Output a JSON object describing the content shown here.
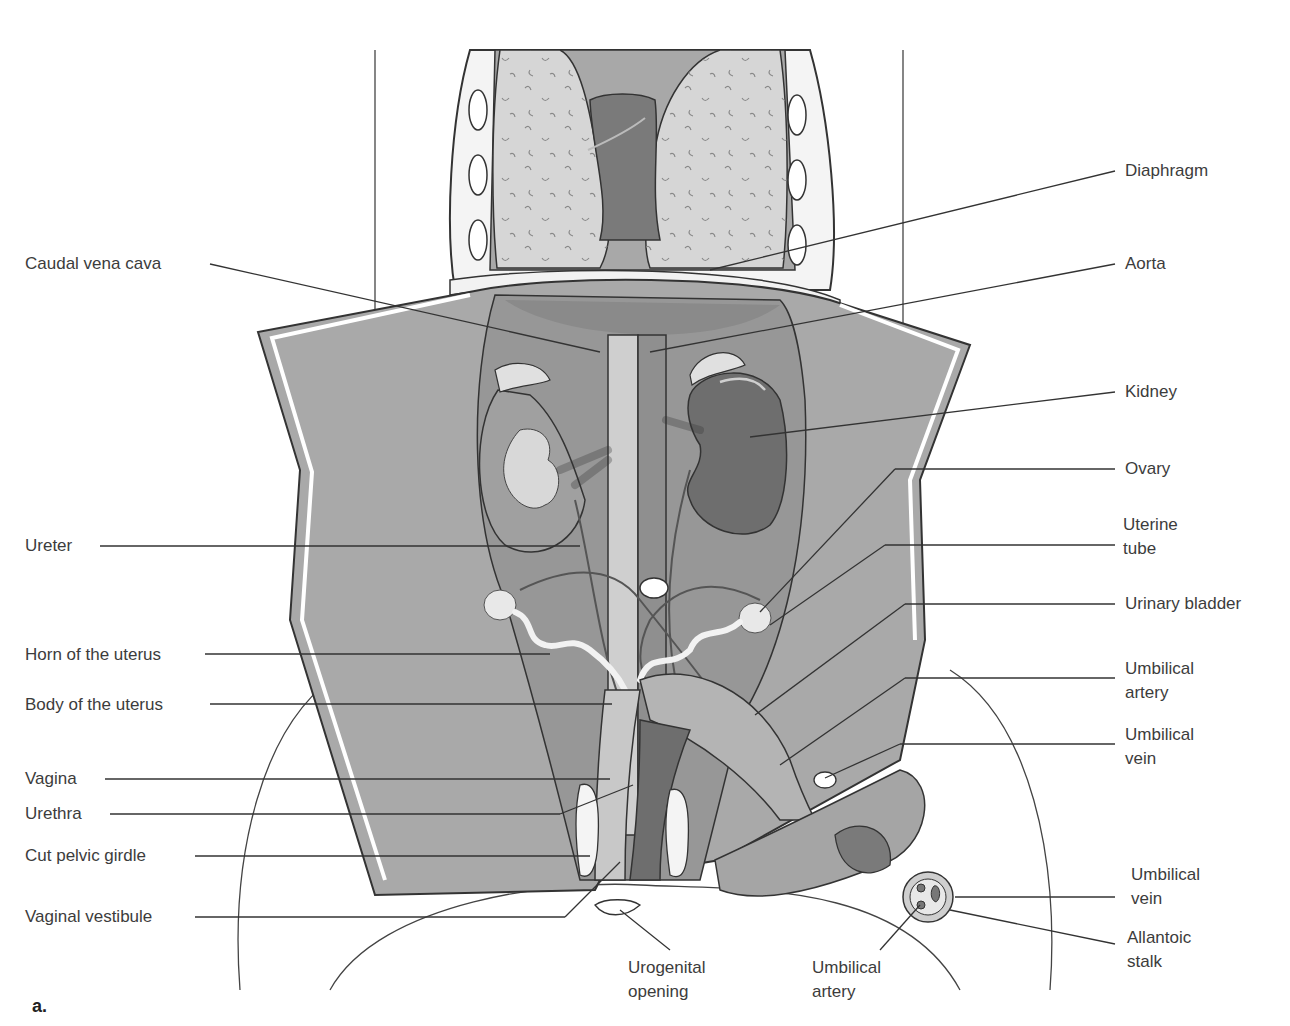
{
  "figure": {
    "panel_label": "a.",
    "colors": {
      "outline": "#2f2f2f",
      "body_wall": "#a9a9a9",
      "cavity": "#9a9a9a",
      "lung": "#c8c8c8",
      "heart": "#7a7a7a",
      "kidney_right": "#6e6e6e",
      "vessel_light": "#cfcfcf",
      "uterus_horn": "#f0f0f0"
    }
  },
  "labels": {
    "left": [
      {
        "id": "caudal-vena-cava",
        "text": "Caudal vena cava"
      },
      {
        "id": "ureter",
        "text": "Ureter"
      },
      {
        "id": "horn-of-uterus",
        "text": "Horn of the uterus"
      },
      {
        "id": "body-of-uterus",
        "text": "Body of the uterus"
      },
      {
        "id": "vagina",
        "text": "Vagina"
      },
      {
        "id": "urethra",
        "text": "Urethra"
      },
      {
        "id": "cut-pelvic-girdle",
        "text": "Cut pelvic girdle"
      },
      {
        "id": "vaginal-vestibule",
        "text": "Vaginal vestibule"
      }
    ],
    "right": [
      {
        "id": "diaphragm",
        "text": "Diaphragm"
      },
      {
        "id": "aorta",
        "text": "Aorta"
      },
      {
        "id": "kidney",
        "text": "Kidney"
      },
      {
        "id": "ovary",
        "text": "Ovary"
      },
      {
        "id": "uterine-tube",
        "text": "Uterine tube"
      },
      {
        "id": "urinary-bladder",
        "text": "Urinary bladder"
      },
      {
        "id": "umbilical-artery-right",
        "text": "Umbilical artery"
      },
      {
        "id": "umbilical-vein-right",
        "text": "Umbilical vein"
      },
      {
        "id": "umbilical-vein-cord",
        "text": "Umbilical vein"
      },
      {
        "id": "allantoic-stalk",
        "text": "Allantoic stalk"
      }
    ],
    "bottom": [
      {
        "id": "urogenital-opening",
        "text": "Urogenital opening"
      },
      {
        "id": "umbilical-artery-cord",
        "text": "Umbilical artery"
      }
    ]
  }
}
